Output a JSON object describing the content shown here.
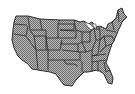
{
  "image": {
    "subject": "us-states-map-icon",
    "fill_color": "#9a9a9a",
    "border_color": "#2a2a2a",
    "background": "#ffffff"
  }
}
